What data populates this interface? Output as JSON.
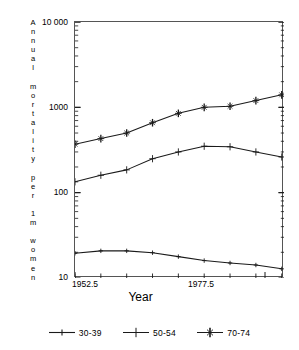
{
  "chart_data": {
    "type": "line",
    "title": "",
    "xlabel": "Year",
    "ylabel": "Annual mortality per 1m women",
    "yscale": "log",
    "ylim": [
      10,
      10000
    ],
    "ytick_labels": [
      "10 000",
      "1000",
      "100",
      "10"
    ],
    "ytick_values": [
      10000,
      1000,
      100,
      10
    ],
    "xlim": [
      1952.5,
      1980.0
    ],
    "xtick_labels": [
      "1952.5",
      "1977.5"
    ],
    "xtick_values": [
      1952.5,
      1977.5
    ],
    "grid": false,
    "legend_position": "bottom",
    "x": [
      1952.5,
      1955.9,
      1959.3,
      1962.7,
      1966.1,
      1969.5,
      1972.9,
      1976.3,
      1979.7
    ],
    "series": [
      {
        "name": "30-39",
        "marker": "plus-small",
        "values": [
          19.5,
          20.8,
          20.8,
          19.8,
          17.8,
          16.0,
          15.0,
          14.2,
          12.8
        ]
      },
      {
        "name": "50-54",
        "marker": "plus-medium",
        "values": [
          134,
          160,
          185,
          250,
          300,
          350,
          345,
          300,
          262
        ]
      },
      {
        "name": "70-74",
        "marker": "plus-star",
        "values": [
          370,
          430,
          500,
          660,
          850,
          1000,
          1030,
          1200,
          1400
        ]
      }
    ]
  },
  "axis": {
    "y_title_chars": [
      "A",
      "n",
      "n",
      "u",
      "a",
      "l",
      "",
      "m",
      "o",
      "r",
      "t",
      "a",
      "l",
      "i",
      "t",
      "y",
      "",
      "p",
      "e",
      "r",
      "",
      "1",
      "m",
      "",
      "w",
      "o",
      "m",
      "e",
      "n"
    ],
    "y_labels": [
      "10 000",
      "1000",
      "100",
      "10"
    ],
    "x_labels": [
      "1952.5",
      "1977.5"
    ],
    "x_title": "Year"
  },
  "legend": {
    "items": [
      {
        "label": "30-39",
        "marker": "plus-small"
      },
      {
        "label": "50-54",
        "marker": "plus-medium"
      },
      {
        "label": "70-74",
        "marker": "plus-star"
      }
    ]
  },
  "colors": {
    "line": "#1a1a1a",
    "frame": "#555555",
    "text": "#000000",
    "background": "#ffffff"
  }
}
